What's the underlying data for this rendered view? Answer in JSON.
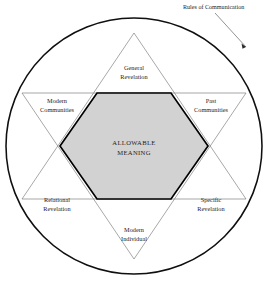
{
  "figure": {
    "callout": {
      "label": "Rules of Communication",
      "target": "outer-circle"
    },
    "center": {
      "line1": "ALLOWABLE",
      "line2": "MEANING"
    },
    "sectors": [
      {
        "id": "general-revelation",
        "line1": "General",
        "line2": "Revelation",
        "position": "top"
      },
      {
        "id": "past-communities",
        "line1": "Past",
        "line2": "Communities",
        "position": "upper-right"
      },
      {
        "id": "specific-revelation",
        "line1": "Specific",
        "line2": "Revelation",
        "position": "lower-right"
      },
      {
        "id": "modern-individual",
        "line1": "Modern",
        "line2": "Individual",
        "position": "bottom"
      },
      {
        "id": "relational-revelation",
        "line1": "Relational",
        "line2": "Revelation",
        "position": "lower-left"
      },
      {
        "id": "modern-communities",
        "line1": "Modern",
        "line2": "Communities",
        "position": "upper-left"
      }
    ],
    "colors": {
      "circle_stroke": "#0f0f0f",
      "triangle_stroke": "#6d6d6d",
      "hexagon_fill": "#d2d2d2",
      "hexagon_stroke": "#000000",
      "text": "#1d1d1d",
      "background": "#ffffff"
    }
  }
}
